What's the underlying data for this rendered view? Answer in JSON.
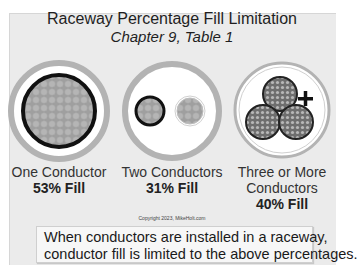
{
  "title": "Raceway Percentage Fill Limitation",
  "subtitle": "Chapter 9, Table 1",
  "figures": [
    {
      "label": "One Conductor",
      "fill": "53% Fill"
    },
    {
      "label": "Two Conductors",
      "fill": "31% Fill"
    },
    {
      "label_line1": "Three or More",
      "label_line2": "Conductors",
      "fill": "40% Fill"
    }
  ],
  "copyright": "Copyright 2023, MikeHolt.com",
  "note": {
    "line1": "When conductors are installed in a raceway,",
    "line2": "conductor fill is limited to the above percentages."
  },
  "colors": {
    "panel": "#ebebeb",
    "raceway_ring": "#b3b3b3",
    "conductor_insulation": "#111111",
    "strands": "#a8a8a8"
  }
}
